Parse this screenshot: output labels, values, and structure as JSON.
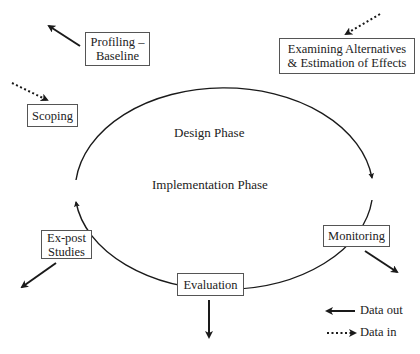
{
  "diagram": {
    "phases": {
      "design": "Design Phase",
      "implementation": "Implementation Phase"
    },
    "nodes": [
      {
        "id": "profiling",
        "lines": [
          "Profiling –",
          "Baseline"
        ],
        "flow": "data-out"
      },
      {
        "id": "examining",
        "lines": [
          "Examining Alternatives",
          "& Estimation of Effects"
        ],
        "flow": "data-in"
      },
      {
        "id": "scoping",
        "lines": [
          "Scoping"
        ],
        "flow": "data-in"
      },
      {
        "id": "monitoring",
        "lines": [
          "Monitoring"
        ],
        "flow": "data-out"
      },
      {
        "id": "evaluation",
        "lines": [
          "Evaluation"
        ],
        "flow": "data-out"
      },
      {
        "id": "ex-post",
        "lines": [
          "Ex-post",
          "Studies"
        ],
        "flow": "data-out"
      }
    ],
    "legend": {
      "data_out": "Data out",
      "data_in": "Data in"
    },
    "colors": {
      "line": "#1a1a1a",
      "box_border": "#555555"
    }
  }
}
